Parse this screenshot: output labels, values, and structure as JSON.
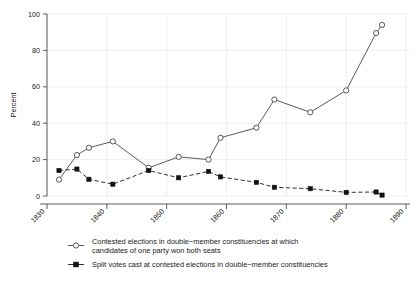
{
  "chart_data": {
    "type": "line",
    "title": "",
    "xlabel": "",
    "ylabel": "Percent",
    "xlim": [
      1830,
      1890
    ],
    "ylim": [
      0,
      100
    ],
    "grid": true,
    "legend_position": "below",
    "x_ticks": [
      "1830",
      "1840",
      "1850",
      "1860",
      "1870",
      "1880",
      "1890"
    ],
    "y_ticks": [
      "0",
      "20",
      "40",
      "60",
      "80",
      "100"
    ],
    "x": [
      1832,
      1835,
      1837,
      1841,
      1847,
      1852,
      1857,
      1859,
      1865,
      1868,
      1874,
      1880,
      1885,
      1886
    ],
    "series": [
      {
        "name": "Contested elections in double−member constituencies at which candidates of one party won both seats",
        "marker": "open-circle",
        "linestyle": "solid",
        "values": [
          9,
          22.5,
          26.5,
          30,
          15.5,
          21.5,
          20,
          32,
          37.5,
          53,
          46,
          58,
          89.5,
          94
        ]
      },
      {
        "name": "Split votes cast at contested elections in double−member constituencies",
        "marker": "filled-square",
        "linestyle": "dashed",
        "values": [
          14,
          14.8,
          9.2,
          6.5,
          14,
          10,
          13.5,
          10.5,
          7.5,
          4.8,
          4,
          2,
          2.2,
          0.5
        ]
      }
    ]
  },
  "legend": {
    "entries": [
      {
        "line1": "Contested elections in double−member constituencies at which",
        "line2": "candidates of one party won both seats"
      },
      {
        "line1": "Split votes cast at contested elections in double−member constituencies",
        "line2": ""
      }
    ]
  },
  "colors": {
    "axis": "#4a4a4a",
    "grid": "#e8e8ec",
    "series_open": "#3d3d3d",
    "series_filled": "#111111",
    "background": "#ffffff"
  }
}
